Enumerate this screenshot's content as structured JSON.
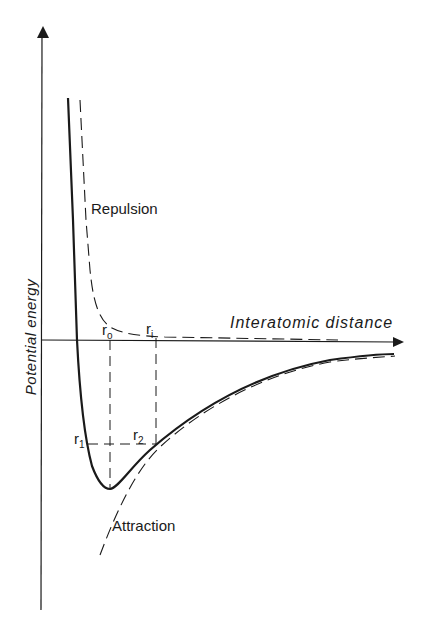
{
  "diagram": {
    "type": "potential-energy-curve",
    "axes": {
      "y_label": "Potential energy",
      "x_label": "Interatomic distance"
    },
    "curve_labels": {
      "repulsion": "Repulsion",
      "attraction": "Attraction"
    },
    "markers": {
      "r0": {
        "base": "r",
        "sub": "o"
      },
      "ri": {
        "base": "r",
        "sub": "i"
      },
      "r1": {
        "base": "r",
        "sub": "1"
      },
      "r2": {
        "base": "r",
        "sub": "2"
      }
    },
    "colors": {
      "ink": "#1a1a1a",
      "background": "#ffffff"
    }
  }
}
